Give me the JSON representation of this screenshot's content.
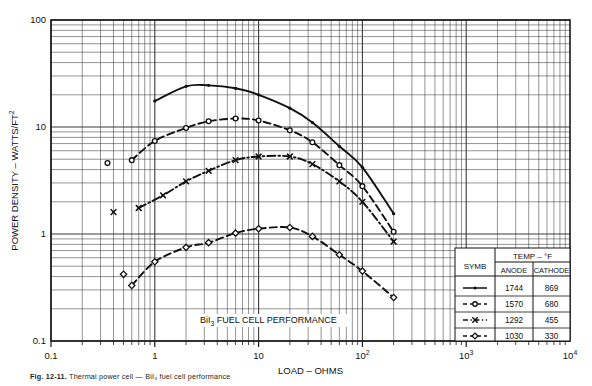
{
  "chart_data": {
    "type": "line",
    "title": "",
    "annotation": "BiI₃ FUEL CELL PERFORMANCE",
    "xlabel": "LOAD – OHMS",
    "ylabel": "POWER DENSITY – WATTS/FT²",
    "xscale": "log",
    "yscale": "log",
    "xlim": [
      0.1,
      10000
    ],
    "ylim": [
      0.1,
      100
    ],
    "grid": "log-minor-both",
    "legend_position": "inside-bottom-right",
    "xticks": [
      "0.1",
      "1",
      "10",
      "10²",
      "10³",
      "10⁴"
    ],
    "xtick_values": [
      0.1,
      1,
      10,
      100,
      1000,
      10000
    ],
    "yticks": [
      "0.1",
      "1",
      "10",
      "100"
    ],
    "ytick_values": [
      0.1,
      1,
      10,
      100
    ],
    "series": [
      {
        "name": "1744 / 869",
        "anode": "1744",
        "cathode": "869",
        "style": "solid",
        "marker": "dot",
        "x": [
          1.0,
          2.0,
          3.3,
          6.0,
          10.0,
          20.0,
          33.0,
          60.0,
          100.0,
          200.0
        ],
        "y": [
          17.5,
          24.0,
          24.5,
          23.0,
          20.0,
          15.0,
          11.0,
          6.6,
          4.2,
          1.55
        ]
      },
      {
        "name": "1570 / 680",
        "anode": "1570",
        "cathode": "680",
        "style": "dashed",
        "marker": "open-circle",
        "x": [
          0.35,
          0.6,
          1.0,
          2.0,
          3.3,
          6.0,
          10.0,
          20.0,
          33.0,
          60.0,
          100.0,
          200.0
        ],
        "y": [
          4.6,
          4.9,
          7.4,
          9.8,
          11.3,
          12.0,
          11.5,
          9.3,
          7.2,
          4.4,
          2.8,
          1.05
        ]
      },
      {
        "name": "1292 / 455",
        "anode": "1292",
        "cathode": "455",
        "style": "dash-dot",
        "marker": "cross",
        "x": [
          0.4,
          0.7,
          1.2,
          2.0,
          3.3,
          6.0,
          10.0,
          20.0,
          33.0,
          60.0,
          100.0,
          200.0
        ],
        "y": [
          1.6,
          1.75,
          2.3,
          3.1,
          3.9,
          4.9,
          5.3,
          5.3,
          4.5,
          3.1,
          2.0,
          0.85
        ]
      },
      {
        "name": "1030 / 330",
        "anode": "1030",
        "cathode": "330",
        "style": "dashed",
        "marker": "diamond",
        "x": [
          0.5,
          0.6,
          1.0,
          2.0,
          3.3,
          6.0,
          10.0,
          20.0,
          33.0,
          60.0,
          100.0,
          200.0
        ],
        "y": [
          0.42,
          0.33,
          0.55,
          0.75,
          0.83,
          1.02,
          1.12,
          1.15,
          0.95,
          0.64,
          0.45,
          0.255
        ]
      }
    ]
  },
  "legend": {
    "symb_header": "SYMB",
    "temp_header": "TEMP – °F",
    "anode_header": "ANODE",
    "cathode_header": "CATHODE",
    "rows": [
      {
        "anode": "1744",
        "cathode": "869",
        "style": "solid",
        "marker": "dot"
      },
      {
        "anode": "1570",
        "cathode": "680",
        "style": "dashed",
        "marker": "open-circle"
      },
      {
        "anode": "1292",
        "cathode": "455",
        "style": "dash-dot",
        "marker": "cross"
      },
      {
        "anode": "1030",
        "cathode": "330",
        "style": "dashed",
        "marker": "diamond"
      }
    ]
  },
  "caption": {
    "label": "Fig. 12-11.",
    "text": "Thermal power cell — BiI₃ fuel cell performance"
  }
}
